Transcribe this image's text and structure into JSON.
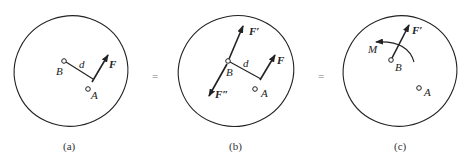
{
  "panels": [
    {
      "id": "a",
      "caption": "(a)",
      "labels": {
        "B": "B",
        "A": "A",
        "d": "d",
        "F": "F"
      }
    },
    {
      "id": "b",
      "caption": "(b)",
      "labels": {
        "B": "B",
        "A": "A",
        "d": "d",
        "F": "F",
        "F_prime": "F′",
        "F_double_prime": "F″"
      }
    },
    {
      "id": "c",
      "caption": "(c)",
      "labels": {
        "B": "B",
        "A": "A",
        "F_prime": "F′",
        "M": "M"
      }
    }
  ],
  "equals": [
    "=",
    "="
  ],
  "colors": {
    "stroke": "#222222",
    "background": "#ffffff"
  }
}
